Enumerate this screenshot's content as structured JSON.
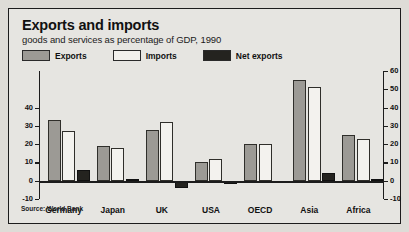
{
  "header": {
    "title": "Exports and imports",
    "subtitle": "goods and services as percentage of GDP, 1990"
  },
  "legend": {
    "items": [
      {
        "label": "Exports",
        "key": "exports",
        "color": "#9c9a95",
        "icon": "legend-swatch"
      },
      {
        "label": "Imports",
        "key": "imports",
        "color": "#f1f0ec",
        "icon": "legend-swatch"
      },
      {
        "label": "Net exports",
        "key": "net",
        "color": "#24231f",
        "icon": "legend-swatch"
      }
    ]
  },
  "source": "Source: World Bank",
  "axes": {
    "left_ticks": [
      "40",
      "30",
      "20",
      "10",
      "0",
      "-10"
    ],
    "right_ticks": [
      "60",
      "50",
      "40",
      "30",
      "20",
      "10",
      "0",
      "-10"
    ]
  },
  "chart_data": {
    "type": "bar",
    "title": "Exports and imports",
    "subtitle": "goods and services as percentage of GDP, 1990",
    "xlabel": "",
    "ylabel": "percentage of GDP",
    "ylim": [
      -10,
      60
    ],
    "left_axis_range": [
      -10,
      40
    ],
    "right_axis_range": [
      -10,
      60
    ],
    "ytick_step": 10,
    "grid": false,
    "legend_position": "top-left",
    "source": "Source: World Bank",
    "categories": [
      "Germany",
      "Japan",
      "UK",
      "USA",
      "OECD",
      "Asia",
      "Africa"
    ],
    "series": [
      {
        "name": "Exports",
        "values": [
          33,
          19,
          28,
          10,
          20,
          55,
          25
        ]
      },
      {
        "name": "Imports",
        "values": [
          27,
          18,
          32,
          12,
          20,
          51,
          23
        ]
      },
      {
        "name": "Net exports",
        "values": [
          6,
          1,
          -4,
          -2,
          0,
          4,
          1
        ]
      }
    ]
  }
}
